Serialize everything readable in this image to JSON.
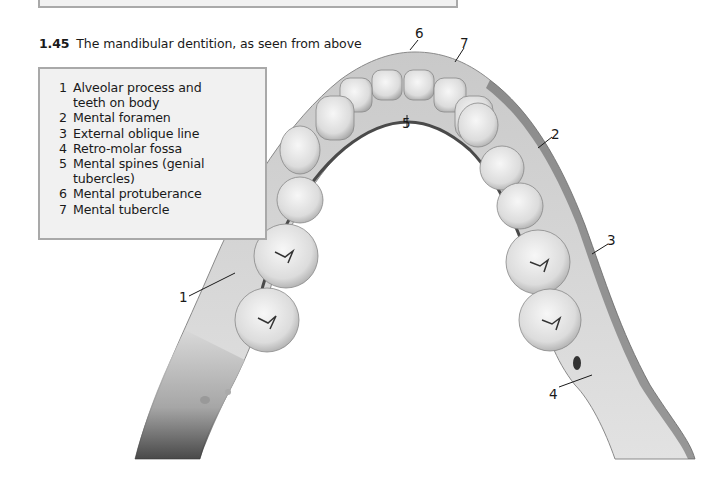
{
  "figure": {
    "number": "1.45",
    "caption": "The mandibular dentition, as seen from above"
  },
  "legend": {
    "items": [
      {
        "n": "1",
        "text": "Alveolar process and teeth on body"
      },
      {
        "n": "2",
        "text": "Mental foramen"
      },
      {
        "n": "3",
        "text": "External oblique line"
      },
      {
        "n": "4",
        "text": "Retro-molar fossa"
      },
      {
        "n": "5",
        "text": "Mental spines (genial tubercles)"
      },
      {
        "n": "6",
        "text": "Mental protuberance"
      },
      {
        "n": "7",
        "text": "Mental tubercle"
      }
    ]
  },
  "labels": {
    "l1": "1",
    "l2": "2",
    "l3": "3",
    "l4": "4",
    "l5": "5",
    "l6": "6",
    "l7": "7"
  },
  "colors": {
    "box_fill": "#f1f1f1",
    "box_border": "#a9a9a9",
    "bone_light": "#d9d9d9",
    "bone_dark": "#7a7a7a"
  }
}
